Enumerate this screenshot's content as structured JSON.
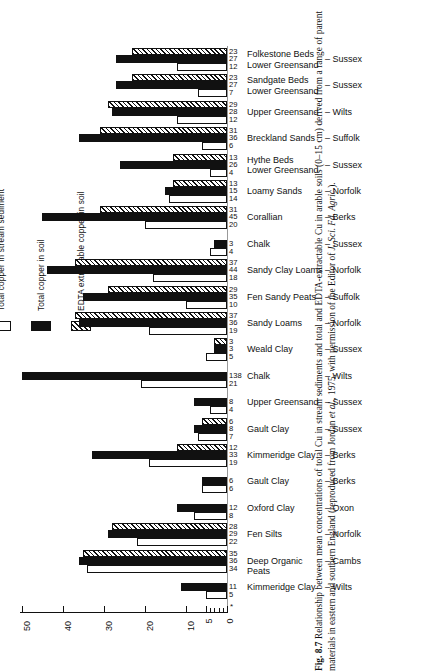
{
  "figure": {
    "number": "Fig. 8.7",
    "caption_text": "Relationship between mean concentrations of total Cu in stream sediments and total and EDTA-extractable Cu in arable soils (0–15 cm) derived from a range of parent materials in eastern and southern England (reproduced from Jordan ",
    "caption_italic_1": "et al.",
    "caption_text_2": ", 1975, with permission of the Editor of ",
    "caption_italic_2": "J. Sci. Fd. Agric.",
    "caption_text_3": ")."
  },
  "legend": {
    "items": [
      {
        "swatch": "white",
        "label": "Total copper in stream sediment"
      },
      {
        "swatch": "black",
        "label": "Total copper in soil"
      },
      {
        "swatch": "hatch",
        "label": "EDTA extractable copper in soil"
      }
    ]
  },
  "axis": {
    "ticks": [
      "50",
      "40",
      "30",
      "20",
      "10",
      "5",
      "0"
    ],
    "minor_ticks": [
      "1",
      "2",
      "3",
      "4"
    ],
    "footnote_marker": "*"
  },
  "chart_data": {
    "type": "bar",
    "title": "Relationship between mean concentrations of total Cu in stream sediments and total and EDTA-extractable Cu in arable soils",
    "xlabel": "Copper concentration (ppm)",
    "ylabel": "",
    "xlim": [
      0,
      50
    ],
    "x_direction": "reversed",
    "grid": false,
    "legend_position": "left-rotated",
    "series": [
      {
        "name": "EDTA extractable copper in soil",
        "style": "hatch"
      },
      {
        "name": "Total copper in soil",
        "style": "black"
      },
      {
        "name": "Total copper in stream sediment",
        "style": "white"
      }
    ],
    "categories": [
      "Folkestone Beds Lower Greensand",
      "Sandgate Beds Lower Greensand",
      "Upper Greensand",
      "Breckland Sands",
      "Hythe Beds Lower Greensand",
      "Loamy Sands",
      "Corallian",
      "Chalk",
      "Sandy Clay Loams",
      "Fen Sandy Peats",
      "Sandy Loams",
      "Weald Clay",
      "Chalk",
      "Upper Greensand",
      "Gault Clay",
      "Kimmeridge Clay",
      "Gault Clay",
      "Oxford Clay",
      "Fen Silts",
      "Deep Organic Peats",
      "Kimmeridge Clay"
    ],
    "rows": [
      {
        "name_line1": "Folkestone Beds",
        "name_line2": "Lower Greensand",
        "county": "– Sussex",
        "edta": 23,
        "soil": 27,
        "sediment": 12
      },
      {
        "name_line1": "Sandgate Beds",
        "name_line2": "Lower Greensand",
        "county": "– Sussex",
        "edta": 23,
        "soil": 27,
        "sediment": 7
      },
      {
        "name_line1": "Upper Greensand",
        "name_line2": "",
        "county": "– Wilts",
        "edta": 29,
        "soil": 28,
        "sediment": 12
      },
      {
        "name_line1": "Breckland Sands",
        "name_line2": "",
        "county": "– Suffolk",
        "edta": 31,
        "soil": 36,
        "sediment": 6
      },
      {
        "name_line1": "Hythe Beds",
        "name_line2": "Lower Greensand",
        "county": "– Sussex",
        "edta": 13,
        "soil": 26,
        "sediment": 4
      },
      {
        "name_line1": "Loamy Sands",
        "name_line2": "",
        "county": "– Norfolk",
        "edta": 13,
        "soil": 15,
        "sediment": 14
      },
      {
        "name_line1": "Corallian",
        "name_line2": "",
        "county": "– Berks",
        "edta": 31,
        "soil": 45,
        "sediment": 20
      },
      {
        "name_line1": "Chalk",
        "name_line2": "",
        "county": "– Sussex",
        "edta": null,
        "soil": 3,
        "sediment": 4
      },
      {
        "name_line1": "Sandy Clay Loams",
        "name_line2": "",
        "county": "– Norfolk",
        "edta": 37,
        "soil": 44,
        "sediment": 18
      },
      {
        "name_line1": "Fen Sandy Peats",
        "name_line2": "",
        "county": "– Suffolk",
        "edta": 29,
        "soil": 35,
        "sediment": 10
      },
      {
        "name_line1": "Sandy Loams",
        "name_line2": "",
        "county": "– Norfolk",
        "edta": 37,
        "soil": 36,
        "sediment": 19
      },
      {
        "name_line1": "Weald Clay",
        "name_line2": "",
        "county": "– Sussex",
        "edta": 3,
        "soil": 3,
        "sediment": 5
      },
      {
        "name_line1": "Chalk",
        "name_line2": "",
        "county": "– Wilts",
        "edta": null,
        "soil": 138,
        "sediment": 21
      },
      {
        "name_line1": "Upper Greensand",
        "name_line2": "",
        "county": "– Sussex",
        "edta": null,
        "soil": 8,
        "sediment": 4
      },
      {
        "name_line1": "Gault Clay",
        "name_line2": "",
        "county": "– Sussex",
        "edta": 6,
        "soil": 8,
        "sediment": 7
      },
      {
        "name_line1": "Kimmeridge Clay",
        "name_line2": "",
        "county": "– Berks",
        "edta": 12,
        "soil": 33,
        "sediment": 19
      },
      {
        "name_line1": "Gault Clay",
        "name_line2": "",
        "county": "– Berks",
        "edta": null,
        "soil": 6,
        "sediment": 6
      },
      {
        "name_line1": "Oxford Clay",
        "name_line2": "",
        "county": "– Oxon",
        "edta": null,
        "soil": 12,
        "sediment": 8
      },
      {
        "name_line1": "Fen Silts",
        "name_line2": "",
        "county": "– Norfolk",
        "edta": 28,
        "soil": 29,
        "sediment": 22
      },
      {
        "name_line1": "Deep Organic Peats",
        "name_line2": "",
        "county": "– Cambs",
        "edta": 35,
        "soil": 36,
        "sediment": 34
      },
      {
        "name_line1": "Kimmeridge Clay",
        "name_line2": "",
        "county": "– Wilts",
        "edta": null,
        "soil": 11,
        "sediment": 5
      }
    ]
  }
}
